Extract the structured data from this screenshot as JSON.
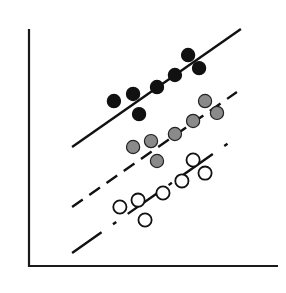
{
  "chart_data": {
    "type": "scatter",
    "title": "",
    "xlabel": "",
    "ylabel": "",
    "xlim": [
      0,
      10
    ],
    "ylim": [
      0,
      10
    ],
    "grid": false,
    "legend": null,
    "ticks": {
      "x": [],
      "y": []
    },
    "series": [
      {
        "name": "filled-black",
        "marker": "filled-circle",
        "fill": "#111111",
        "stroke": "#111111",
        "points": [
          [
            3.41,
            6.96
          ],
          [
            4.18,
            7.26
          ],
          [
            4.42,
            6.41
          ],
          [
            5.14,
            7.55
          ],
          [
            5.86,
            8.06
          ],
          [
            6.39,
            8.9
          ],
          [
            6.83,
            8.35
          ]
        ],
        "fit_line": {
          "style": "solid",
          "from": [
            1.73,
            5.02
          ],
          "to": [
            8.51,
            10.0
          ]
        }
      },
      {
        "name": "filled-gray",
        "marker": "filled-circle",
        "fill": "#8a8a8a",
        "stroke": "#222222",
        "points": [
          [
            4.18,
            5.02
          ],
          [
            4.9,
            5.27
          ],
          [
            5.14,
            4.43
          ],
          [
            5.86,
            5.57
          ],
          [
            6.59,
            6.12
          ],
          [
            7.07,
            6.96
          ],
          [
            7.55,
            6.46
          ]
        ],
        "fit_line": {
          "style": "dashed",
          "from": [
            1.73,
            2.49
          ],
          "to": [
            8.35,
            7.34
          ]
        }
      },
      {
        "name": "open-white",
        "marker": "open-circle",
        "fill": "#ffffff",
        "stroke": "#111111",
        "points": [
          [
            3.65,
            2.49
          ],
          [
            4.38,
            2.78
          ],
          [
            4.66,
            1.94
          ],
          [
            5.38,
            3.08
          ],
          [
            6.14,
            3.59
          ],
          [
            6.59,
            4.47
          ],
          [
            7.07,
            3.92
          ]
        ],
        "fit_line": {
          "style": "long-dashed",
          "from": [
            1.73,
            0.55
          ],
          "to": [
            8.19,
            5.32
          ]
        }
      }
    ]
  },
  "axes": {
    "color": "#1a1a1a"
  }
}
